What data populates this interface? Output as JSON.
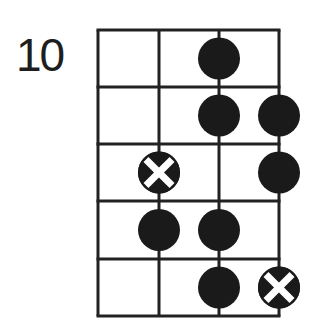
{
  "diagram": {
    "type": "fretboard-scale-diagram",
    "start_fret_label": "10",
    "strings": 4,
    "frets_shown": 5,
    "colors": {
      "line": "#222222",
      "dot": "#1a1a1a",
      "root_mark": "#ffffff",
      "background": "#ffffff",
      "label": "#1e1e1e"
    },
    "geometry": {
      "string_x": [
        98,
        159,
        219,
        279
      ],
      "fret_y": [
        30,
        87,
        144,
        201,
        259,
        316
      ],
      "dot_radius": 21
    },
    "notes": [
      {
        "fret_row": 1,
        "string": 3,
        "root": false
      },
      {
        "fret_row": 2,
        "string": 3,
        "root": false
      },
      {
        "fret_row": 2,
        "string": 4,
        "root": false
      },
      {
        "fret_row": 3,
        "string": 2,
        "root": true
      },
      {
        "fret_row": 3,
        "string": 4,
        "root": false
      },
      {
        "fret_row": 4,
        "string": 2,
        "root": false
      },
      {
        "fret_row": 4,
        "string": 3,
        "root": false
      },
      {
        "fret_row": 5,
        "string": 3,
        "root": false
      },
      {
        "fret_row": 5,
        "string": 4,
        "root": true
      }
    ]
  }
}
